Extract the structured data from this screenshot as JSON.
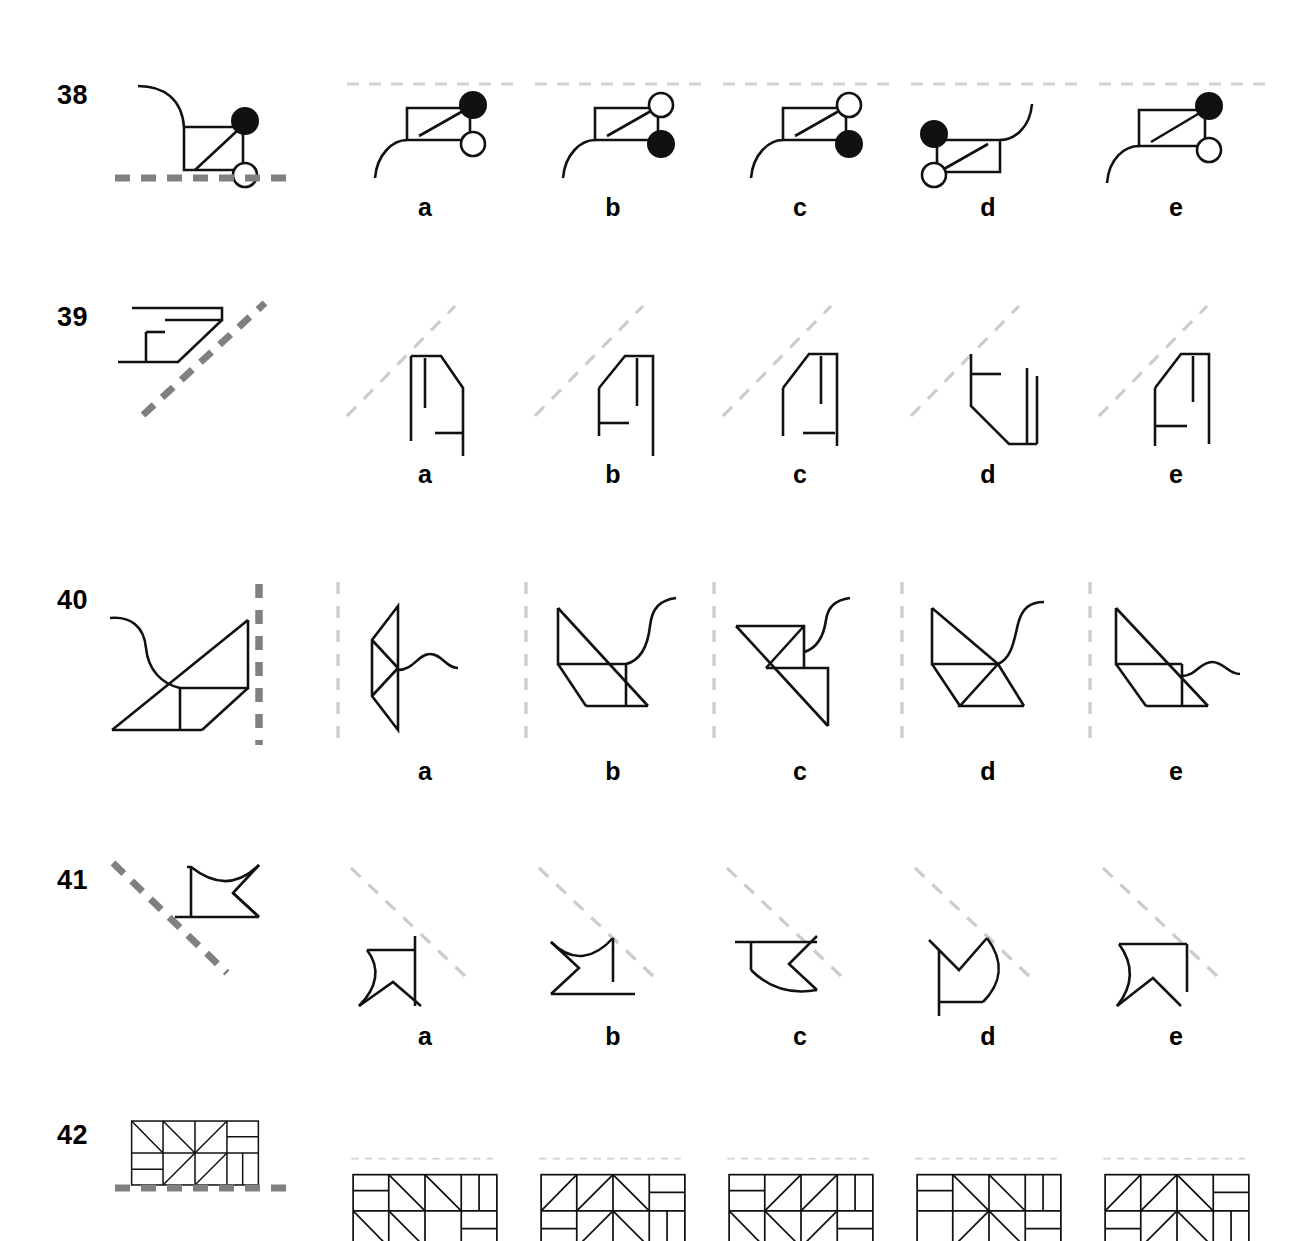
{
  "page": {
    "background_color": "#ffffff",
    "ink_color": "#111111",
    "mirror_strong_color": "#808080",
    "mirror_light_color": "#cccccc"
  },
  "option_labels": [
    "a",
    "b",
    "c",
    "d",
    "e"
  ],
  "items": [
    {
      "number": "38",
      "mirror_type": "horizontal",
      "mirror_note": "horizontal dashed line below the stimulus figure",
      "stimulus_description": "rectangle with internal diagonal, curved tail at upper-left, filled circle at top-right corner, open circle at lower-right corner",
      "options": [
        {
          "label": "a",
          "description": "rectangle with diagonal, curve descending at lower-left, filled circle top-right, open circle mid-right"
        },
        {
          "label": "b",
          "description": "rectangle with diagonal, curve descending at lower-left, open circle top-right, filled circle mid-right"
        },
        {
          "label": "c",
          "description": "rectangle with diagonal, curve descending at lower-left, open circle top-right, filled circle mid-right"
        },
        {
          "label": "d",
          "description": "mirrored rectangle with diagonal, curve rising at right, filled circle top-left, open circle lower-left"
        },
        {
          "label": "e",
          "description": "rectangle with diagonal, curve descending at left, filled circle top-right, open circle mid-right"
        }
      ]
    },
    {
      "number": "39",
      "mirror_type": "diagonal-up",
      "mirror_note": "diagonal dashed line rising to the right, placed to the right of the stimulus",
      "stimulus_description": "flat angular hook shape opening left with short vertical stem, pointing right",
      "options": [
        {
          "label": "a",
          "description": "upright angular shape, vertical left edge, slanted right shoulder, small foot bracket at lower right"
        },
        {
          "label": "b",
          "description": "upright angular shape, slanted left shoulder, long vertical right edge, foot bracket at lower left"
        },
        {
          "label": "c",
          "description": "upright angular shape, slanted left shoulder, vertical right edge, small foot bracket centered"
        },
        {
          "label": "d",
          "description": "shape with bracket at upper left, slanted lower-left edge, double vertical bars at right"
        },
        {
          "label": "e",
          "description": "upright angular shape, slanted left shoulder, vertical right edge, bracket at lower left"
        }
      ]
    },
    {
      "number": "40",
      "mirror_type": "vertical",
      "mirror_note": "vertical dashed line to the right of the stimulus figure",
      "stimulus_description": "parallelogram of triangles along a rising diagonal with an S-curve tail at upper left",
      "options": [
        {
          "label": "a",
          "description": "vertical diamond of triangles with S-curve extending right at middle"
        },
        {
          "label": "b",
          "description": "triangles along descending diagonal with S-curve rising to the right at middle"
        },
        {
          "label": "c",
          "description": "triangles along descending diagonal, S-curve rising at upper right"
        },
        {
          "label": "d",
          "description": "triangles along descending diagonal with S-curve rising from center"
        },
        {
          "label": "e",
          "description": "triangles along descending diagonal with S-curve extending right at middle"
        }
      ]
    },
    {
      "number": "41",
      "mirror_type": "diagonal-down",
      "mirror_note": "diagonal dashed line descending to the right, placed left of the stimulus",
      "stimulus_description": "pennant flag with concave top, notched swallowtail to the right, horizontal staff at bottom",
      "options": [
        {
          "label": "a",
          "description": "flag with concave left edge, notched bottom, vertical staff at right"
        },
        {
          "label": "b",
          "description": "flag with concave top, notch opening left, horizontal staff at bottom"
        },
        {
          "label": "c",
          "description": "flag with notch opening right, concave bottom edge, horizontal staff at top"
        },
        {
          "label": "d",
          "description": "flag with V-notch at top, concave right edge, vertical staff at left"
        },
        {
          "label": "e",
          "description": "flag with concave left edge, notched bottom, straight top edge"
        }
      ]
    },
    {
      "number": "42",
      "mirror_type": "horizontal",
      "mirror_note": "horizontal dashed line below the stimulus figure",
      "stimulus_description": "wide rectangle divided into a 4x2 grid of cells containing triangles and subdivided bars",
      "options": [
        {
          "label": "a",
          "description": "4x2 grid of triangles and bars, variation a"
        },
        {
          "label": "b",
          "description": "4x2 grid of triangles and bars, variation b"
        },
        {
          "label": "c",
          "description": "4x2 grid of triangles and bars, variation c"
        },
        {
          "label": "d",
          "description": "4x2 grid of triangles and bars, variation d"
        },
        {
          "label": "e",
          "description": "4x2 grid of triangles and bars, variation e"
        }
      ]
    }
  ]
}
